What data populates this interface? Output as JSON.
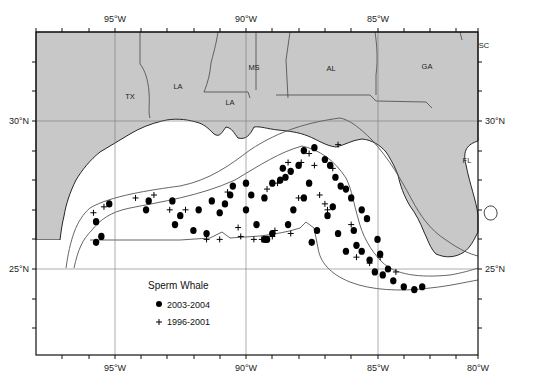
{
  "map": {
    "title": "Sperm Whale",
    "region": "Gulf of Mexico",
    "extent": {
      "lon_min": -98,
      "lon_max": -80,
      "lat_min": 22,
      "lat_max": 32
    },
    "x_ticks_labeled": [
      "95°W",
      "90°W",
      "85°W",
      "80°W"
    ],
    "y_ticks_labeled": [
      "30°N",
      "25°N"
    ],
    "state_labels": [
      "TX",
      "LA",
      "LA",
      "MS",
      "AL",
      "GA",
      "SC",
      "FL"
    ],
    "colors": {
      "land": "#c8c8c8",
      "water": "#ffffff",
      "coast": "#111111",
      "grid": "#777777",
      "isobath": "#555555",
      "marker": "#000000"
    }
  },
  "legend": {
    "title": "Sperm Whale",
    "items": [
      {
        "symbol": "filled-circle",
        "label": "2003-2004"
      },
      {
        "symbol": "plus",
        "label": "1996-2001"
      }
    ]
  },
  "chart_data": {
    "type": "scatter",
    "title": "Sperm Whale",
    "xlabel": "Longitude",
    "ylabel": "Latitude",
    "x_ticks": [
      "95°W",
      "90°W",
      "85°W",
      "80°W"
    ],
    "y_ticks": [
      "30°N",
      "25°N"
    ],
    "grid": true,
    "legend_position": "lower-left",
    "series": [
      {
        "name": "2003-2004",
        "marker": "filled-circle",
        "points": [
          [
            -95.7,
            26.6
          ],
          [
            -95.5,
            26.1
          ],
          [
            -95.7,
            25.9
          ],
          [
            -95.2,
            27.2
          ],
          [
            -93.8,
            27.0
          ],
          [
            -93.7,
            27.3
          ],
          [
            -92.8,
            27.3
          ],
          [
            -92.5,
            26.8
          ],
          [
            -92.7,
            26.5
          ],
          [
            -91.8,
            27.0
          ],
          [
            -91.3,
            27.3
          ],
          [
            -91.0,
            26.9
          ],
          [
            -90.6,
            27.5
          ],
          [
            -90.5,
            27.8
          ],
          [
            -90.0,
            27.9
          ],
          [
            -89.8,
            27.5
          ],
          [
            -89.3,
            27.4
          ],
          [
            -89.0,
            27.9
          ],
          [
            -88.7,
            28.0
          ],
          [
            -88.3,
            28.3
          ],
          [
            -88.0,
            28.5
          ],
          [
            -87.8,
            29.0
          ],
          [
            -87.4,
            29.1
          ],
          [
            -87.0,
            28.7
          ],
          [
            -86.8,
            28.5
          ],
          [
            -86.6,
            28.1
          ],
          [
            -86.4,
            27.8
          ],
          [
            -86.2,
            27.7
          ],
          [
            -86.0,
            27.4
          ],
          [
            -85.6,
            27.0
          ],
          [
            -85.4,
            26.7
          ],
          [
            -85.0,
            26.0
          ],
          [
            -84.9,
            25.5
          ],
          [
            -84.6,
            25.0
          ],
          [
            -84.4,
            24.6
          ],
          [
            -84.0,
            24.4
          ],
          [
            -83.6,
            24.3
          ],
          [
            -83.3,
            24.4
          ],
          [
            -90.0,
            27.0
          ],
          [
            -89.6,
            26.5
          ],
          [
            -89.3,
            26.0
          ],
          [
            -89.0,
            26.2
          ],
          [
            -88.4,
            26.5
          ],
          [
            -88.2,
            27.0
          ],
          [
            -87.8,
            27.4
          ],
          [
            -87.3,
            26.3
          ],
          [
            -86.9,
            26.8
          ],
          [
            -86.5,
            26.2
          ],
          [
            -85.8,
            25.8
          ],
          [
            -85.3,
            25.3
          ],
          [
            -85.1,
            24.9
          ],
          [
            -86.2,
            25.6
          ],
          [
            -87.5,
            25.9
          ],
          [
            -89.2,
            26.0
          ],
          [
            -91.5,
            26.2
          ],
          [
            -92.0,
            26.3
          ],
          [
            -90.8,
            27.2
          ],
          [
            -88.6,
            28.4
          ],
          [
            -88.5,
            28.1
          ],
          [
            -87.6,
            27.9
          ],
          [
            -86.7,
            27.1
          ],
          [
            -85.9,
            26.3
          ],
          [
            -85.6,
            25.6
          ],
          [
            -84.8,
            24.8
          ]
        ]
      },
      {
        "name": "1996-2001",
        "marker": "plus",
        "points": [
          [
            -95.8,
            26.9
          ],
          [
            -95.4,
            27.1
          ],
          [
            -94.2,
            27.4
          ],
          [
            -93.5,
            27.5
          ],
          [
            -92.3,
            27.0
          ],
          [
            -91.5,
            26.0
          ],
          [
            -91.0,
            26.0
          ],
          [
            -90.2,
            26.1
          ],
          [
            -89.7,
            26.0
          ],
          [
            -89.4,
            26.0
          ],
          [
            -89.0,
            26.1
          ],
          [
            -88.3,
            26.2
          ],
          [
            -88.0,
            27.4
          ],
          [
            -87.9,
            28.6
          ],
          [
            -87.6,
            28.9
          ],
          [
            -87.4,
            28.5
          ],
          [
            -87.2,
            27.5
          ],
          [
            -87.0,
            27.2
          ],
          [
            -86.7,
            28.4
          ],
          [
            -86.5,
            29.2
          ],
          [
            -86.0,
            26.5
          ],
          [
            -85.3,
            25.2
          ],
          [
            -84.9,
            25.4
          ],
          [
            -84.3,
            24.9
          ],
          [
            -90.7,
            27.6
          ],
          [
            -90.3,
            26.4
          ],
          [
            -89.2,
            27.7
          ],
          [
            -88.8,
            27.9
          ],
          [
            -88.4,
            28.6
          ],
          [
            -86.9,
            27.0
          ],
          [
            -85.8,
            25.4
          ],
          [
            -88.9,
            26.3
          ],
          [
            -92.9,
            27.0
          ]
        ]
      }
    ]
  }
}
